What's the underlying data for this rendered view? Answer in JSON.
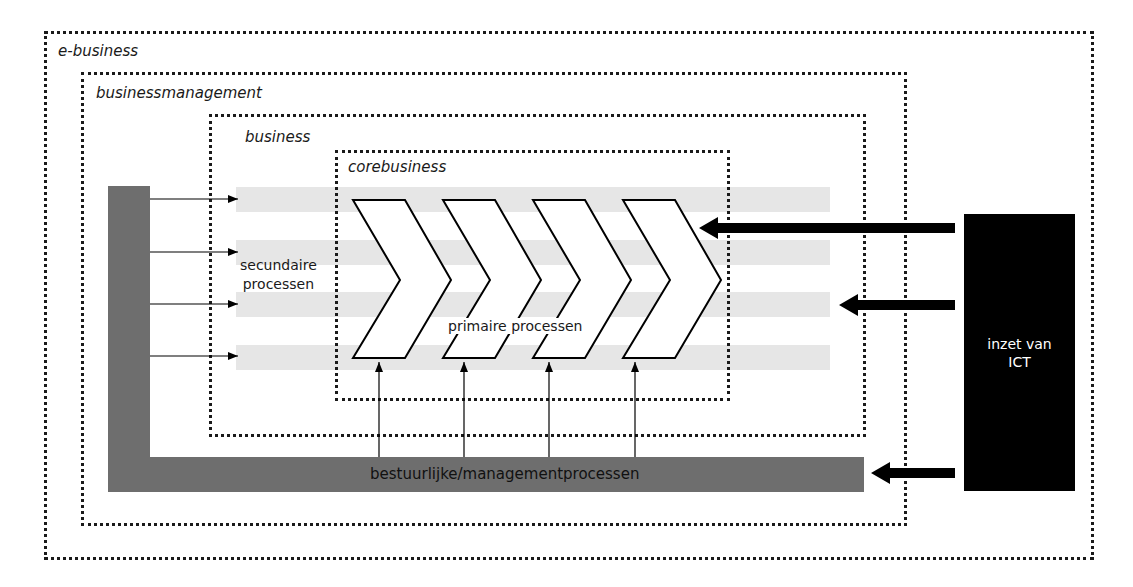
{
  "diagram": {
    "layers": [
      {
        "id": "e-business",
        "label": "e-business"
      },
      {
        "id": "businessmanagement",
        "label": "businessmanagement"
      },
      {
        "id": "business",
        "label": "business"
      },
      {
        "id": "corebusiness",
        "label": "corebusiness"
      }
    ],
    "secondary_processes_label": "secundaire processen",
    "secondary_processes_line1": "secundaire",
    "secondary_processes_line2": "processen",
    "primary_processes_label": "primaire processen",
    "primary_chevron_count": 4,
    "management_processes_label": "bestuurlijke/managementprocessen",
    "ict_label_line1": "inzet van",
    "ict_label_line2": "ICT",
    "colors": {
      "border": "#1a1a1a",
      "stripe": "#e6e6e6",
      "management_bar": "#6e6e6e",
      "ict_box": "#000000",
      "chevron_fill": "#ffffff"
    }
  }
}
